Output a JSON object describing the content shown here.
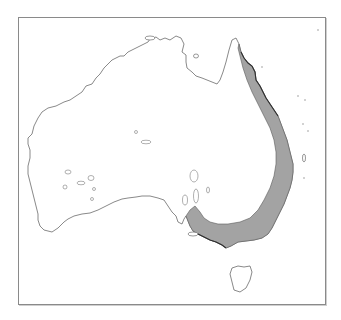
{
  "map": {
    "region": "Australia",
    "subject": "species distribution range",
    "range_area": "Eastern Australia — from Cape York Peninsula south along the east coast to Victoria and south-eastern South Australia",
    "colors": {
      "range_fill": "#a3a3a3",
      "outline": "#6b6b6b",
      "frame": "#8a8a8a",
      "background": "#ffffff"
    }
  }
}
